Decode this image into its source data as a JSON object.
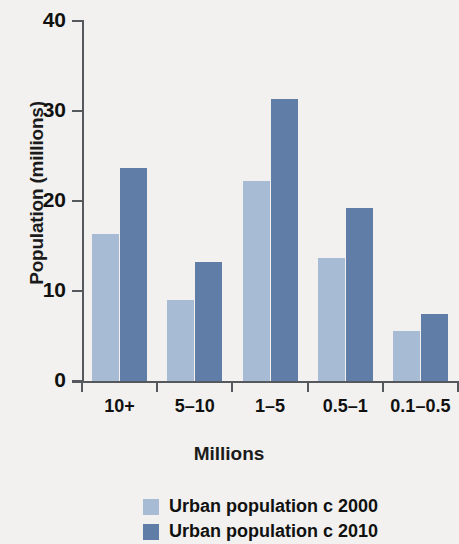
{
  "chart_data": {
    "type": "bar",
    "title": "",
    "xlabel": "Millions",
    "ylabel": "Population (millions)",
    "categories": [
      "10+",
      "5–10",
      "1–5",
      "0.5–1",
      "0.1–0.5"
    ],
    "series": [
      {
        "name": "Urban population c 2000",
        "color": "#a7bcd4",
        "values": [
          16.3,
          9.0,
          22.2,
          13.7,
          5.6
        ]
      },
      {
        "name": "Urban population c 2010",
        "color": "#5f7da6",
        "values": [
          23.7,
          13.2,
          31.3,
          19.2,
          7.4
        ]
      }
    ],
    "ylim": [
      0,
      40
    ],
    "yticks": [
      0,
      10,
      20,
      30,
      40
    ],
    "ytick_labels": [
      "0",
      "10",
      "20",
      "30",
      "40"
    ],
    "grid": false,
    "legend_position": "bottom-center"
  },
  "legend": {
    "items": [
      {
        "label": "Urban population c 2000"
      },
      {
        "label": "Urban population c 2010"
      }
    ]
  },
  "colors": {
    "background": "#f2f1ef",
    "axis": "#55585c",
    "text": "#111111",
    "series_2000": "#a7bcd4",
    "series_2010": "#5f7da6"
  }
}
